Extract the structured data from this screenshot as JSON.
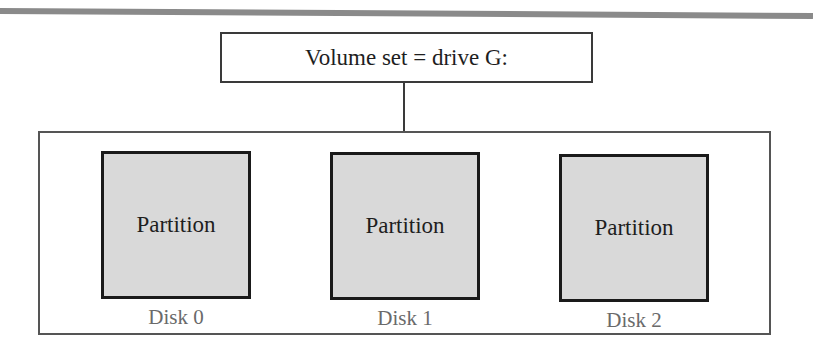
{
  "diagram": {
    "volume_set": {
      "label": "Volume set = drive G:"
    },
    "disks": [
      {
        "partition_label": "Partition",
        "disk_label": "Disk 0"
      },
      {
        "partition_label": "Partition",
        "disk_label": "Disk 1"
      },
      {
        "partition_label": "Partition",
        "disk_label": "Disk 2"
      }
    ]
  },
  "colors": {
    "top_rule": "#8a8a8a",
    "box_border": "#3a3a3a",
    "partition_fill": "#d9d9d9",
    "partition_border": "#1a1a1a",
    "disk_label_text": "#6a6a6a"
  }
}
